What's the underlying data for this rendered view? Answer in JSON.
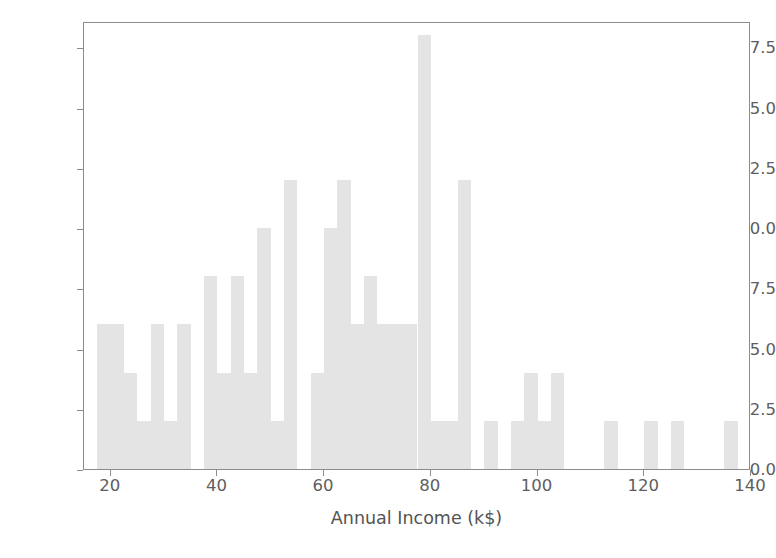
{
  "chart_data": {
    "type": "bar",
    "title": "",
    "subtitle": "",
    "xlabel": "Annual Income (k$)",
    "ylabel": "",
    "xlim": [
      15,
      140
    ],
    "ylim": [
      0.0,
      18.6
    ],
    "grid": false,
    "legend": null,
    "bin_width": 2.5,
    "bar_color": "#e4e4e4",
    "axis_color": "#8c8c8c",
    "tick_label_color": "#5e5e5e",
    "x_ticks": [
      20,
      40,
      60,
      80,
      100,
      120,
      140
    ],
    "x_tick_labels": [
      "20",
      "40",
      "60",
      "80",
      "100",
      "120",
      "140"
    ],
    "y_ticks": [
      0.0,
      2.5,
      5.0,
      7.5,
      10.0,
      12.5,
      15.0,
      17.5
    ],
    "y_tick_labels": [
      "0.0",
      "2.5",
      "5.0",
      "7.5",
      "10.0",
      "12.5",
      "15.0",
      "17.5"
    ],
    "bins": [
      {
        "start": 15.0,
        "end": 17.5,
        "value": 0
      },
      {
        "start": 17.5,
        "end": 20.0,
        "value": 6
      },
      {
        "start": 20.0,
        "end": 22.5,
        "value": 6
      },
      {
        "start": 22.5,
        "end": 25.0,
        "value": 4
      },
      {
        "start": 25.0,
        "end": 27.5,
        "value": 2
      },
      {
        "start": 27.5,
        "end": 30.0,
        "value": 6
      },
      {
        "start": 30.0,
        "end": 32.5,
        "value": 2
      },
      {
        "start": 32.5,
        "end": 35.0,
        "value": 6
      },
      {
        "start": 35.0,
        "end": 37.5,
        "value": 0
      },
      {
        "start": 37.5,
        "end": 40.0,
        "value": 8
      },
      {
        "start": 40.0,
        "end": 42.5,
        "value": 4
      },
      {
        "start": 42.5,
        "end": 45.0,
        "value": 8
      },
      {
        "start": 45.0,
        "end": 47.5,
        "value": 4
      },
      {
        "start": 47.5,
        "end": 50.0,
        "value": 10
      },
      {
        "start": 50.0,
        "end": 52.5,
        "value": 2
      },
      {
        "start": 52.5,
        "end": 55.0,
        "value": 12
      },
      {
        "start": 55.0,
        "end": 57.5,
        "value": 0
      },
      {
        "start": 57.5,
        "end": 60.0,
        "value": 4
      },
      {
        "start": 60.0,
        "end": 62.5,
        "value": 10
      },
      {
        "start": 62.5,
        "end": 65.0,
        "value": 12
      },
      {
        "start": 65.0,
        "end": 67.5,
        "value": 6
      },
      {
        "start": 67.5,
        "end": 70.0,
        "value": 8
      },
      {
        "start": 70.0,
        "end": 72.5,
        "value": 6
      },
      {
        "start": 72.5,
        "end": 75.0,
        "value": 6
      },
      {
        "start": 75.0,
        "end": 77.5,
        "value": 6
      },
      {
        "start": 77.5,
        "end": 80.0,
        "value": 18
      },
      {
        "start": 80.0,
        "end": 82.5,
        "value": 2
      },
      {
        "start": 82.5,
        "end": 85.0,
        "value": 2
      },
      {
        "start": 85.0,
        "end": 87.5,
        "value": 12
      },
      {
        "start": 87.5,
        "end": 90.0,
        "value": 0
      },
      {
        "start": 90.0,
        "end": 92.5,
        "value": 2
      },
      {
        "start": 92.5,
        "end": 95.0,
        "value": 0
      },
      {
        "start": 95.0,
        "end": 97.5,
        "value": 2
      },
      {
        "start": 97.5,
        "end": 100.0,
        "value": 4
      },
      {
        "start": 100.0,
        "end": 102.5,
        "value": 2
      },
      {
        "start": 102.5,
        "end": 105.0,
        "value": 4
      },
      {
        "start": 105.0,
        "end": 112.5,
        "value": 0
      },
      {
        "start": 112.5,
        "end": 115.0,
        "value": 2
      },
      {
        "start": 115.0,
        "end": 120.0,
        "value": 0
      },
      {
        "start": 120.0,
        "end": 122.5,
        "value": 2
      },
      {
        "start": 122.5,
        "end": 125.0,
        "value": 0
      },
      {
        "start": 125.0,
        "end": 127.5,
        "value": 2
      },
      {
        "start": 127.5,
        "end": 135.0,
        "value": 0
      },
      {
        "start": 135.0,
        "end": 137.5,
        "value": 2
      }
    ]
  }
}
